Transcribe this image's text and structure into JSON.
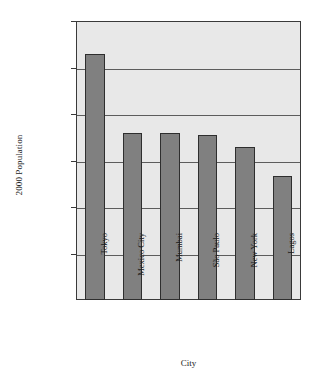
{
  "chart_data": {
    "type": "bar",
    "title": "",
    "xlabel": "City",
    "ylabel": "2000 Population",
    "categories": [
      "Tokyo",
      "Mexico City",
      "Mumbai",
      "São Paulo",
      "New York",
      "Lagos"
    ],
    "values": [
      26400000,
      18000000,
      18000000,
      17700000,
      16500000,
      13300000
    ],
    "ylim": [
      0,
      30000000
    ],
    "ytick_values": [
      5000000,
      10000000,
      15000000,
      20000000,
      25000000,
      30000000
    ],
    "ytick_labels": [
      "5,000,000",
      "10,000,000",
      "15,000,000",
      "20,000,000",
      "25,000,000",
      "30,000,000"
    ],
    "grid": true,
    "grid_axis": "y",
    "legend": false,
    "legend_position": "none",
    "orientation": "vertical",
    "xtick_rotation": 90,
    "colors": {
      "bar_fill": "#808080",
      "bar_outline": "#2e2e2e",
      "plot_background": "#e8e8e8",
      "page_background": "#ffffff",
      "gridline": "#5c5c5c",
      "axis_line": "#3a3a3a",
      "text": "#1a1a1a"
    }
  }
}
